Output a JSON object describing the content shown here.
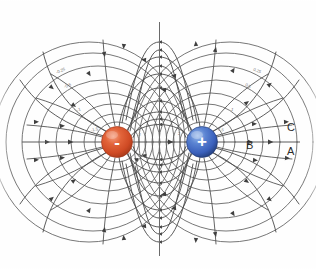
{
  "figure": {
    "background_color": "#fefefe",
    "line_color": "#4a4a4a",
    "axis_color": "#5a5a5a"
  },
  "charges": {
    "negative": {
      "label": "-",
      "name": "negative-charge",
      "color": "#d9512c",
      "highlight_color": "#f08a5d",
      "edge_color": "#a83a1c",
      "cx": 117,
      "cy": 142,
      "r": 15
    },
    "positive": {
      "label": "+",
      "name": "positive-charge",
      "color": "#3f68c0",
      "highlight_color": "#7fa3e0",
      "edge_color": "#27407f",
      "cx": 202,
      "cy": 142,
      "r": 15
    }
  },
  "region_labels": [
    {
      "text": "C",
      "x": 287,
      "y": 122
    },
    {
      "text": "B",
      "x": 246,
      "y": 140
    },
    {
      "text": "A",
      "x": 287,
      "y": 146
    }
  ],
  "potential_labels": [
    {
      "text": "-0.25",
      "x": 56,
      "y": 69,
      "rotate": -22
    },
    {
      "text": "-0.5",
      "x": 64,
      "y": 84,
      "rotate": -22
    },
    {
      "text": "-1",
      "x": 77,
      "y": 108,
      "rotate": -18
    },
    {
      "text": "-1.5",
      "x": 91,
      "y": 128,
      "rotate": -10
    },
    {
      "text": "-2",
      "x": 137,
      "y": 133,
      "rotate": 0
    },
    {
      "text": "2",
      "x": 178,
      "y": 132,
      "rotate": 0
    },
    {
      "text": "1.5",
      "x": 218,
      "y": 128,
      "rotate": 10
    },
    {
      "text": "1",
      "x": 231,
      "y": 108,
      "rotate": 18
    },
    {
      "text": "0.5",
      "x": 245,
      "y": 84,
      "rotate": 22
    },
    {
      "text": "0.25",
      "x": 253,
      "y": 69,
      "rotate": 22
    }
  ],
  "legend": {
    "field_lines": "Electric field lines",
    "equipotentials": "Equipotential lines",
    "axis": "Dipole axis"
  },
  "geometry": {
    "center_x": 159.5,
    "center_y": 142,
    "axis_left_x": 22,
    "axis_right_x": 300,
    "vertical_top_y": 22,
    "vertical_bottom_y": 256
  }
}
